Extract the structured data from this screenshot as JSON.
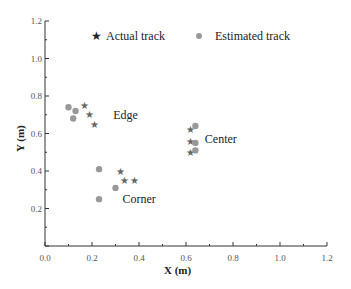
{
  "chart_data": {
    "type": "scatter",
    "title": "",
    "xlabel": "X (m)",
    "ylabel": "Y (m)",
    "xlim": [
      0.0,
      1.2
    ],
    "ylim": [
      0.0,
      1.2
    ],
    "xticks": [
      "0.0",
      "0.2",
      "0.4",
      "0.6",
      "0.8",
      "1.0",
      "1.2"
    ],
    "yticks": [
      "0.2",
      "0.4",
      "0.6",
      "0.8",
      "1.0",
      "1.2"
    ],
    "grid": false,
    "legend_position": "top",
    "series": [
      {
        "name": "Actual track",
        "marker": "star",
        "color": "#666666",
        "points": [
          [
            0.17,
            0.75
          ],
          [
            0.19,
            0.7
          ],
          [
            0.21,
            0.65
          ],
          [
            0.62,
            0.62
          ],
          [
            0.62,
            0.56
          ],
          [
            0.62,
            0.5
          ],
          [
            0.32,
            0.4
          ],
          [
            0.34,
            0.35
          ],
          [
            0.38,
            0.35
          ]
        ]
      },
      {
        "name": "Estimated track",
        "marker": "circle",
        "color": "#999999",
        "points": [
          [
            0.1,
            0.74
          ],
          [
            0.13,
            0.72
          ],
          [
            0.12,
            0.68
          ],
          [
            0.64,
            0.64
          ],
          [
            0.64,
            0.55
          ],
          [
            0.64,
            0.51
          ],
          [
            0.23,
            0.41
          ],
          [
            0.3,
            0.31
          ],
          [
            0.23,
            0.25
          ]
        ]
      }
    ],
    "annotations": [
      {
        "text": "Edge",
        "x": 0.29,
        "y": 0.7
      },
      {
        "text": "Center",
        "x": 0.68,
        "y": 0.57
      },
      {
        "text": "Corner",
        "x": 0.33,
        "y": 0.25
      }
    ]
  },
  "legend": {
    "actual": "Actual track",
    "estimated": "Estimated track"
  }
}
